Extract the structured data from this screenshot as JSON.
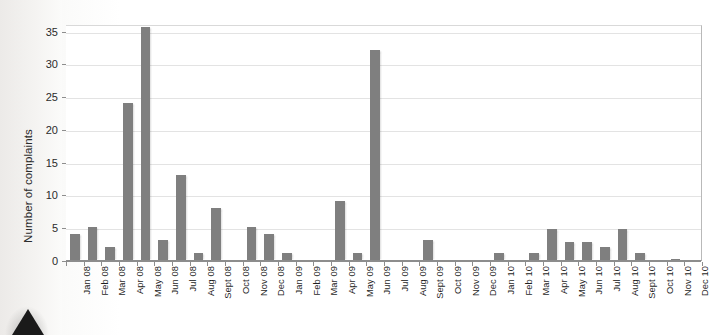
{
  "chart_data": {
    "type": "bar",
    "title": "",
    "xlabel": "",
    "ylabel": "Number of complaints",
    "ylim": [
      0,
      36
    ],
    "yticks": [
      0,
      5,
      10,
      15,
      20,
      25,
      30,
      35
    ],
    "ytick_labels": [
      "0",
      "5",
      "10",
      "15",
      "20",
      "25",
      "30",
      "35"
    ],
    "grid": true,
    "legend": "none",
    "bar_color": "#7f7f7f",
    "categories": [
      "Jan 08",
      "Feb 08",
      "Mar 08",
      "Apr 08",
      "May 08",
      "Jun 08",
      "Jul 08",
      "Aug 08",
      "Sept 08",
      "Oct 08",
      "Nov 08",
      "Dec 08",
      "Jan 09",
      "Feb 09",
      "Mar 09",
      "Apr 09",
      "May 09",
      "Jun 09",
      "Jul 09",
      "Aug 09",
      "Sept 09",
      "Oct 09",
      "Nov 09",
      "Dec 09",
      "Jan 10",
      "Feb 10",
      "Mar 10",
      "Apr 10",
      "May 10",
      "Jun 10",
      "Jul 10",
      "Aug 10",
      "Sept 10",
      "Oct 10",
      "Nov 10",
      "Dec 10"
    ],
    "values": [
      4,
      5,
      2,
      24,
      35.5,
      3,
      13,
      1,
      8,
      0,
      5,
      4,
      1,
      0,
      0,
      9,
      1,
      32,
      0,
      0,
      3,
      0,
      0,
      0,
      1,
      0,
      1,
      4.7,
      2.8,
      2.8,
      2,
      4.8,
      1,
      0,
      0.2,
      0
    ]
  },
  "decor": {
    "scan_arrow": "triangle-marker"
  }
}
